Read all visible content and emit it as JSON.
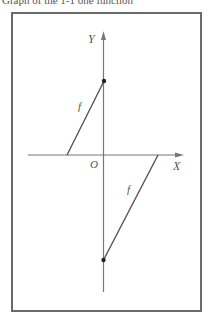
{
  "caption": "Graph of the 1-1 one function",
  "diagram": {
    "axes": {
      "x_label": "X",
      "y_label": "Y",
      "origin_label": "O"
    },
    "function_label": "f",
    "segments": [
      {
        "name": "upper-left-segment",
        "label": "f",
        "from": "x-axis intercept (negative x)",
        "to": "filled point on positive y-axis"
      },
      {
        "name": "lower-right-segment",
        "label": "f",
        "from": "filled point on negative y-axis",
        "to": "x-axis intercept (positive x)"
      }
    ],
    "colors": {
      "axis": "#777777",
      "line": "#555555",
      "frame": "#6a6a6a",
      "point": "#222222"
    }
  }
}
